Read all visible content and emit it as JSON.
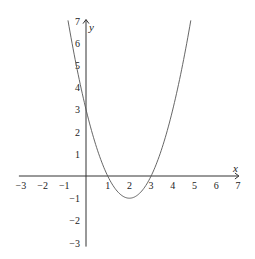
{
  "chart_data": {
    "type": "line",
    "title": "",
    "xlabel": "x",
    "ylabel": "y",
    "function": "y = x^2 - 4x + 3",
    "xlim": [
      -3,
      7
    ],
    "ylim": [
      -3,
      7
    ],
    "grid": false,
    "x_ticks": [
      -3,
      -2,
      -1,
      1,
      2,
      3,
      4,
      5,
      6,
      7
    ],
    "y_ticks": [
      -3,
      -2,
      -1,
      1,
      2,
      3,
      4,
      5,
      6,
      7
    ],
    "x_tick_labels": [
      "−3",
      "−2",
      "−1",
      "1",
      "2",
      "3",
      "4",
      "5",
      "6",
      "7"
    ],
    "y_tick_labels": [
      "−3",
      "−2",
      "−1",
      "1",
      "2",
      "3",
      "4",
      "5",
      "6",
      "7"
    ],
    "series": [
      {
        "name": "parabola",
        "x": [
          -0.83,
          0,
          1,
          2,
          3,
          4,
          4.83
        ],
        "y": [
          7,
          3,
          0,
          -1,
          0,
          3,
          7
        ]
      }
    ],
    "key_points": {
      "roots": [
        1,
        3
      ],
      "vertex": [
        2,
        -1
      ],
      "y_intercept": 3
    }
  },
  "colors": {
    "axis": "#333333",
    "curve": "#555555",
    "text": "#222222",
    "background": "#ffffff"
  }
}
